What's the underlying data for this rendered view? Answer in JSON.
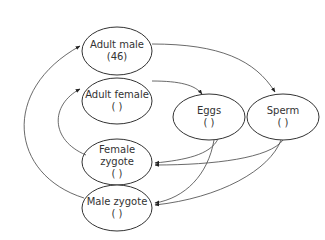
{
  "diagram": {
    "type": "life-cycle-flow",
    "nodes": [
      {
        "id": "adult_male",
        "line1": "Adult male",
        "line2": "(46)",
        "line3": "",
        "cx": 117,
        "cy": 51,
        "rx": 35,
        "ry": 24
      },
      {
        "id": "adult_female",
        "line1": "Adult female",
        "line2": "(   )",
        "line3": "",
        "cx": 117,
        "cy": 101,
        "rx": 35,
        "ry": 23
      },
      {
        "id": "eggs",
        "line1": "Eggs",
        "line2": "(   )",
        "line3": "",
        "cx": 209,
        "cy": 117,
        "rx": 36,
        "ry": 23
      },
      {
        "id": "sperm",
        "line1": "Sperm",
        "line2": "(   )",
        "line3": "",
        "cx": 283,
        "cy": 117,
        "rx": 36,
        "ry": 23
      },
      {
        "id": "female_zygote",
        "line1": "Female",
        "line2": "zygote",
        "line3": "(   )",
        "cx": 117,
        "cy": 162,
        "rx": 35,
        "ry": 23
      },
      {
        "id": "male_zygote",
        "line1": "Male zygote",
        "line2": "(   )",
        "line3": "",
        "cx": 117,
        "cy": 208,
        "rx": 35,
        "ry": 23
      }
    ],
    "edges": [
      {
        "from": "adult_male",
        "to": "sperm"
      },
      {
        "from": "adult_female",
        "to": "eggs"
      },
      {
        "from": "eggs",
        "to": "female_zygote"
      },
      {
        "from": "eggs",
        "to": "male_zygote"
      },
      {
        "from": "sperm",
        "to": "female_zygote"
      },
      {
        "from": "sperm",
        "to": "male_zygote"
      },
      {
        "from": "female_zygote",
        "to": "adult_female"
      },
      {
        "from": "male_zygote",
        "to": "adult_male"
      }
    ],
    "colors": {
      "stroke": "#333333",
      "text": "#333333",
      "background": "#ffffff"
    }
  }
}
